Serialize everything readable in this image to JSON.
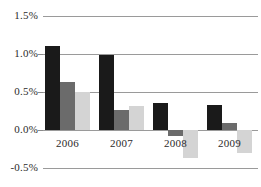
{
  "chart_data": {
    "type": "bar",
    "title": "",
    "subtitle": "",
    "xlabel": "",
    "ylabel": "",
    "categories": [
      "2006",
      "2007",
      "2008",
      "2009"
    ],
    "series": [
      {
        "name": "series-1",
        "color": "#1a1a1a",
        "values": [
          1.1,
          0.99,
          0.35,
          0.33
        ]
      },
      {
        "name": "series-2",
        "color": "#6b6b6b",
        "values": [
          0.63,
          0.26,
          -0.08,
          0.09
        ]
      },
      {
        "name": "series-3",
        "color": "#d4d4d4",
        "values": [
          0.5,
          0.31,
          -0.37,
          -0.3
        ]
      }
    ],
    "ylim": [
      -0.5,
      1.5
    ],
    "ytick_values": [
      1.5,
      1.0,
      0.5,
      0.0,
      -0.5
    ],
    "ytick_labels": [
      "1.5%",
      "1.0%",
      "0.5%",
      "0.0%",
      "-0.5%"
    ],
    "unit": "%",
    "grid": true,
    "legend": "none",
    "gridline_color": "#9a9a9a",
    "background_color": "#ffffff",
    "text_color": "#2b2b2b"
  }
}
